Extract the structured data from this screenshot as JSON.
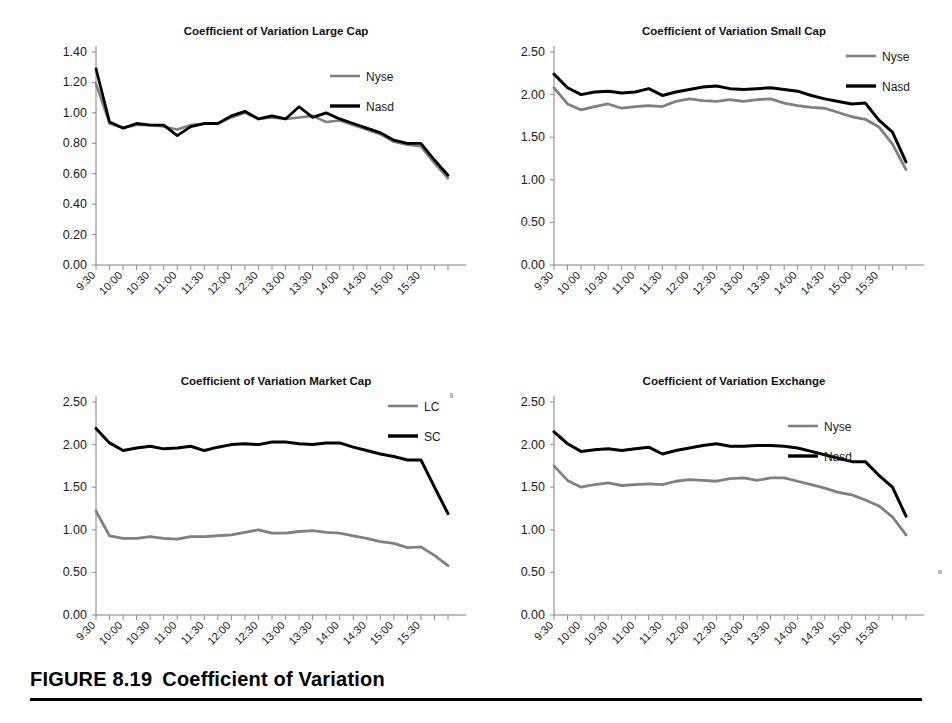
{
  "figure": {
    "caption_number": "FIGURE 8.19",
    "caption_title": "Coefficient of Variation"
  },
  "legend_colors": {
    "gray_series": "#808080",
    "black_series": "#000000"
  },
  "x_tick_labels": [
    "9:30",
    "10:00",
    "10:30",
    "11:00",
    "11:30",
    "12:00",
    "12:30",
    "13:00",
    "13:30",
    "14:00",
    "14:30",
    "15:00",
    "15:30"
  ],
  "chart_data": [
    {
      "id": "large-cap",
      "type": "line",
      "title": "Coefficient of Variation Large Cap",
      "xlabel": "",
      "ylabel": "",
      "ylim": [
        0.0,
        1.4
      ],
      "ytick_labels": [
        "0.00",
        "0.20",
        "0.40",
        "0.60",
        "0.80",
        "1.00",
        "1.20",
        "1.40"
      ],
      "ytick_values": [
        0.0,
        0.2,
        0.4,
        0.6,
        0.8,
        1.0,
        1.2,
        1.4
      ],
      "grid": false,
      "legend_position": "top-right-inside",
      "x": [
        "9:30",
        "9:45",
        "10:00",
        "10:15",
        "10:30",
        "10:45",
        "11:00",
        "11:15",
        "11:30",
        "11:45",
        "12:00",
        "12:15",
        "12:30",
        "12:45",
        "13:00",
        "13:15",
        "13:30",
        "13:45",
        "14:00",
        "14:15",
        "14:30",
        "14:45",
        "15:00",
        "15:15",
        "15:30",
        "15:45",
        "16:00"
      ],
      "series": [
        {
          "name": "Nyse",
          "color": "#808080",
          "width": 2.6,
          "values": [
            1.19,
            0.93,
            0.9,
            0.92,
            0.92,
            0.91,
            0.89,
            0.92,
            0.93,
            0.93,
            0.97,
            1.0,
            0.96,
            0.97,
            0.96,
            0.97,
            0.98,
            0.94,
            0.95,
            0.92,
            0.89,
            0.86,
            0.81,
            0.79,
            0.78,
            0.67,
            0.57
          ]
        },
        {
          "name": "Nasd",
          "color": "#000000",
          "width": 2.8,
          "values": [
            1.29,
            0.94,
            0.9,
            0.93,
            0.92,
            0.92,
            0.85,
            0.91,
            0.93,
            0.93,
            0.98,
            1.01,
            0.96,
            0.98,
            0.96,
            1.04,
            0.97,
            1.0,
            0.96,
            0.93,
            0.9,
            0.87,
            0.82,
            0.8,
            0.8,
            0.69,
            0.59
          ]
        }
      ]
    },
    {
      "id": "small-cap",
      "type": "line",
      "title": "Coefficient of Variation Small Cap",
      "xlabel": "",
      "ylabel": "",
      "ylim": [
        0.0,
        2.5
      ],
      "ytick_labels": [
        "0.00",
        "0.50",
        "1.00",
        "1.50",
        "2.00",
        "2.50"
      ],
      "ytick_values": [
        0.0,
        0.5,
        1.0,
        1.5,
        2.0,
        2.5
      ],
      "grid": false,
      "legend_position": "top-right-outside",
      "x": [
        "9:30",
        "9:45",
        "10:00",
        "10:15",
        "10:30",
        "10:45",
        "11:00",
        "11:15",
        "11:30",
        "11:45",
        "12:00",
        "12:15",
        "12:30",
        "12:45",
        "13:00",
        "13:15",
        "13:30",
        "13:45",
        "14:00",
        "14:15",
        "14:30",
        "14:45",
        "15:00",
        "15:15",
        "15:30",
        "15:45",
        "16:00"
      ],
      "series": [
        {
          "name": "Nyse",
          "color": "#808080",
          "width": 2.8,
          "values": [
            2.08,
            1.89,
            1.82,
            1.86,
            1.89,
            1.84,
            1.86,
            1.87,
            1.86,
            1.92,
            1.95,
            1.93,
            1.92,
            1.94,
            1.92,
            1.94,
            1.95,
            1.9,
            1.87,
            1.85,
            1.84,
            1.79,
            1.74,
            1.71,
            1.62,
            1.42,
            1.12
          ]
        },
        {
          "name": "Nasd",
          "color": "#000000",
          "width": 3.0,
          "values": [
            2.24,
            2.08,
            2.0,
            2.03,
            2.04,
            2.02,
            2.03,
            2.07,
            1.99,
            2.03,
            2.06,
            2.09,
            2.1,
            2.07,
            2.06,
            2.07,
            2.08,
            2.06,
            2.04,
            1.99,
            1.95,
            1.92,
            1.89,
            1.9,
            1.7,
            1.56,
            1.21
          ]
        }
      ]
    },
    {
      "id": "market-cap",
      "type": "line",
      "title": "Coefficient of Variation Market Cap",
      "xlabel": "",
      "ylabel": "",
      "ylim": [
        0.0,
        2.5
      ],
      "ytick_labels": [
        "0.00",
        "0.50",
        "1.00",
        "1.50",
        "2.00",
        "2.50"
      ],
      "ytick_values": [
        0.0,
        0.5,
        1.0,
        1.5,
        2.0,
        2.5
      ],
      "grid": false,
      "legend_position": "top-right-outside",
      "x": [
        "9:30",
        "9:45",
        "10:00",
        "10:15",
        "10:30",
        "10:45",
        "11:00",
        "11:15",
        "11:30",
        "11:45",
        "12:00",
        "12:15",
        "12:30",
        "12:45",
        "13:00",
        "13:15",
        "13:30",
        "13:45",
        "14:00",
        "14:15",
        "14:30",
        "14:45",
        "15:00",
        "15:15",
        "15:30",
        "15:45",
        "16:00"
      ],
      "series": [
        {
          "name": "LC",
          "color": "#808080",
          "width": 2.8,
          "values": [
            1.22,
            0.93,
            0.9,
            0.9,
            0.92,
            0.9,
            0.89,
            0.92,
            0.92,
            0.93,
            0.94,
            0.97,
            1.0,
            0.96,
            0.96,
            0.98,
            0.99,
            0.97,
            0.96,
            0.93,
            0.9,
            0.86,
            0.84,
            0.79,
            0.8,
            0.7,
            0.58
          ]
        },
        {
          "name": "SC",
          "color": "#000000",
          "width": 3.0,
          "values": [
            2.19,
            2.02,
            1.93,
            1.96,
            1.98,
            1.95,
            1.96,
            1.98,
            1.93,
            1.97,
            2.0,
            2.01,
            2.0,
            2.03,
            2.03,
            2.01,
            2.0,
            2.02,
            2.02,
            1.97,
            1.93,
            1.89,
            1.86,
            1.82,
            1.82,
            1.5,
            1.19
          ]
        }
      ]
    },
    {
      "id": "exchange",
      "type": "line",
      "title": "Coefficient of Variation Exchange",
      "xlabel": "",
      "ylabel": "",
      "ylim": [
        0.0,
        2.5
      ],
      "ytick_labels": [
        "0.00",
        "0.50",
        "1.00",
        "1.50",
        "2.00",
        "2.50"
      ],
      "ytick_values": [
        0.0,
        0.5,
        1.0,
        1.5,
        2.0,
        2.5
      ],
      "grid": false,
      "legend_position": "top-right-inside",
      "x": [
        "9:30",
        "9:45",
        "10:00",
        "10:15",
        "10:30",
        "10:45",
        "11:00",
        "11:15",
        "11:30",
        "11:45",
        "12:00",
        "12:15",
        "12:30",
        "12:45",
        "13:00",
        "13:15",
        "13:30",
        "13:45",
        "14:00",
        "14:15",
        "14:30",
        "14:45",
        "15:00",
        "15:15",
        "15:30",
        "15:45",
        "16:00"
      ],
      "series": [
        {
          "name": "Nyse",
          "color": "#808080",
          "width": 2.8,
          "values": [
            1.75,
            1.58,
            1.5,
            1.53,
            1.55,
            1.52,
            1.53,
            1.54,
            1.53,
            1.57,
            1.59,
            1.58,
            1.57,
            1.6,
            1.61,
            1.58,
            1.61,
            1.61,
            1.57,
            1.53,
            1.49,
            1.44,
            1.41,
            1.35,
            1.28,
            1.15,
            0.94
          ]
        },
        {
          "name": "Nasd",
          "color": "#000000",
          "width": 3.0,
          "values": [
            2.15,
            2.01,
            1.92,
            1.94,
            1.95,
            1.93,
            1.95,
            1.97,
            1.89,
            1.93,
            1.96,
            1.99,
            2.01,
            1.98,
            1.98,
            1.99,
            1.99,
            1.98,
            1.96,
            1.92,
            1.88,
            1.84,
            1.8,
            1.8,
            1.64,
            1.5,
            1.16
          ]
        }
      ]
    }
  ]
}
